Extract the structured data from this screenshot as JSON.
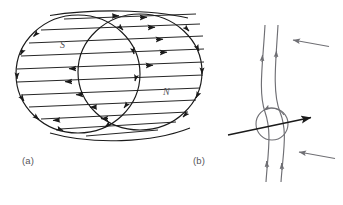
{
  "figure": {
    "background_color": "#ffffff",
    "ink_color": "#1a1a1a",
    "secondary_ink_color": "#6f6f74",
    "label_color": "#55555a",
    "panels": [
      {
        "id": "a",
        "caption": "(a)",
        "description": "bar-magnet-cylinder-with-internal-field-lines",
        "pole_labels": [
          {
            "name": "south-pole-label",
            "text": "S",
            "x": 60,
            "y": 45
          },
          {
            "name": "north-pole-label",
            "text": "N",
            "x": 163,
            "y": 92
          }
        ],
        "field_line_count": 11,
        "left_face_flow": "leftward",
        "right_face_flow": "rightward"
      },
      {
        "id": "b",
        "caption": "(b)",
        "description": "field-lines-deflected-around-current-carrying-conductor",
        "conductor": {
          "name": "conductor-circle",
          "cx": 272,
          "cy": 124,
          "r": 16,
          "circulation": "counterclockwise"
        },
        "force_arrow": {
          "name": "force-arrow",
          "direction": "rightward",
          "x1": 228,
          "y1": 135,
          "x2": 313,
          "y2": 117
        },
        "field_lines": [
          {
            "name": "field-line-left",
            "direction": "upward"
          },
          {
            "name": "field-line-right",
            "direction": "upward"
          }
        ],
        "side_arrows": [
          {
            "name": "side-arrow-top",
            "direction": "leftward",
            "x1": 328,
            "y1": 46,
            "x2": 292,
            "y2": 40
          },
          {
            "name": "side-arrow-bottom",
            "direction": "leftward",
            "x1": 334,
            "y1": 158,
            "x2": 298,
            "y2": 152
          }
        ]
      }
    ]
  }
}
